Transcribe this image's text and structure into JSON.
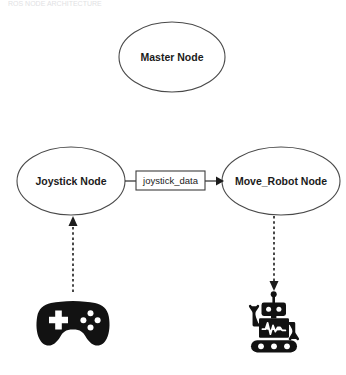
{
  "figure": {
    "clipped_caption": "ROS NODE ARCHITECTURE",
    "background_color": "#ffffff",
    "stroke_color": "#4a4a4a",
    "glyph_color": "#121212"
  },
  "nodes": [
    {
      "id": "master",
      "label": "Master Node",
      "shape": "ellipse",
      "cx": 172,
      "cy": 57,
      "rx": 53,
      "ry": 35
    },
    {
      "id": "joystick",
      "label": "Joystick Node",
      "shape": "ellipse",
      "cx": 71,
      "cy": 181,
      "rx": 54,
      "ry": 34
    },
    {
      "id": "move_robot",
      "label": "Move_Robot Node",
      "shape": "ellipse",
      "cx": 281,
      "cy": 181,
      "rx": 59,
      "ry": 34
    }
  ],
  "topics": [
    {
      "id": "joystick_data",
      "label": "joystick_data",
      "shape": "rect",
      "x": 136,
      "y": 171,
      "width": 69,
      "height": 19,
      "from": "joystick",
      "to": "move_robot",
      "line_style": "solid",
      "arrow": "to-move_robot"
    }
  ],
  "devices": [
    {
      "id": "gamepad",
      "icon": "gamepad-icon",
      "cx": 73,
      "cy": 322
    },
    {
      "id": "robot",
      "icon": "robot-icon",
      "cx": 274,
      "cy": 322
    }
  ],
  "device_links": [
    {
      "id": "gamepad-to-joystick",
      "from": "gamepad",
      "to": "joystick",
      "line_style": "dashed",
      "direction": "up"
    },
    {
      "id": "move_robot-to-robot",
      "from": "move_robot",
      "to": "robot",
      "line_style": "dashed",
      "direction": "down"
    }
  ]
}
